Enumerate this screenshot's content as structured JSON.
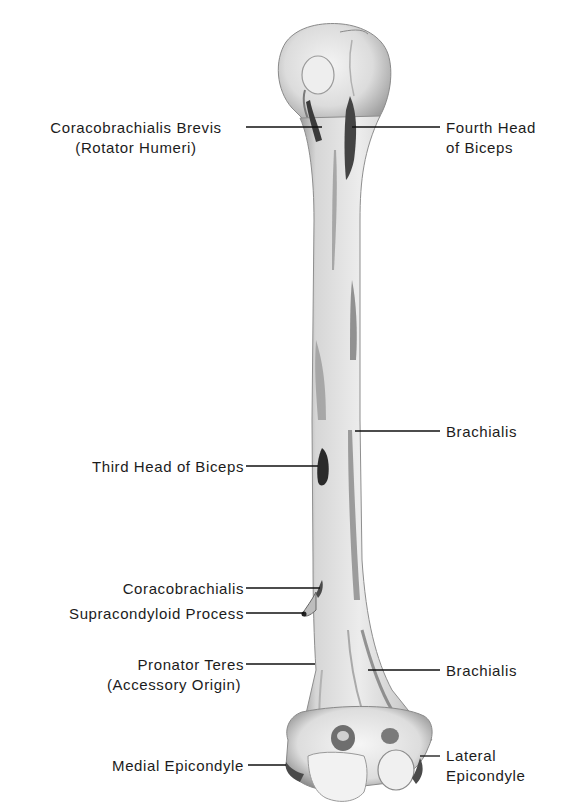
{
  "figure": {
    "colors": {
      "background": "#ffffff",
      "bone_light": "#eeeeee",
      "bone_mid": "#c8c8c8",
      "bone_dark": "#7a7a7a",
      "muscle_attachment": "#3a3a3a",
      "leader_line": "#111111",
      "text": "#1c1c1c"
    }
  },
  "labels": {
    "coracobrachialis_brevis": {
      "line1": "Coracobrachialis Brevis",
      "line2": "(Rotator Humeri)"
    },
    "fourth_head_biceps": {
      "line1": "Fourth Head",
      "line2": "of Biceps"
    },
    "brachialis_upper": {
      "line1": "Brachialis"
    },
    "third_head_biceps": {
      "line1": "Third Head of Biceps"
    },
    "coracobrachialis": {
      "line1": "Coracobrachialis"
    },
    "supracondyloid_process": {
      "line1": "Supracondyloid Process"
    },
    "pronator_teres": {
      "line1": "Pronator Teres",
      "line2": "(Accessory Origin)"
    },
    "brachialis_lower": {
      "line1": "Brachialis"
    },
    "medial_epicondyle": {
      "line1": "Medial Epicondyle"
    },
    "lateral_epicondyle": {
      "line1": "Lateral",
      "line2": "Epicondyle"
    }
  }
}
